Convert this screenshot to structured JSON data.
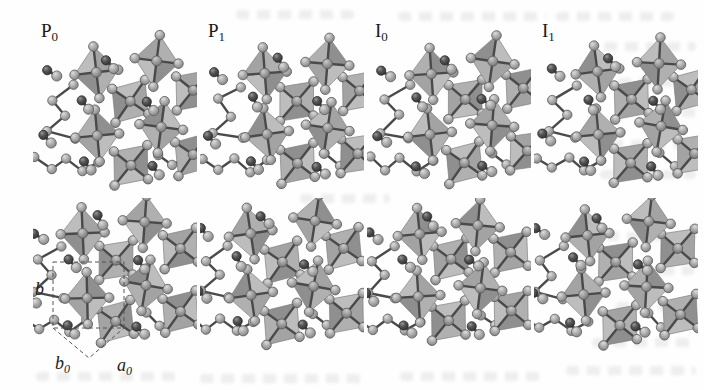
{
  "figure": {
    "type": "crystal-structure-figure",
    "panels": [
      {
        "id": "p0",
        "label_main": "P",
        "label_sub": "0",
        "row": 0,
        "col": 0
      },
      {
        "id": "p1",
        "label_main": "P",
        "label_sub": "1",
        "row": 0,
        "col": 1
      },
      {
        "id": "i0",
        "label_main": "I",
        "label_sub": "0",
        "row": 0,
        "col": 2
      },
      {
        "id": "i1",
        "label_main": "I",
        "label_sub": "1",
        "row": 0,
        "col": 3
      },
      {
        "id": "p0-lower",
        "label_main": "",
        "label_sub": "",
        "row": 1,
        "col": 0,
        "has_cell_annotation": true
      },
      {
        "id": "p1-lower",
        "label_main": "",
        "label_sub": "",
        "row": 1,
        "col": 1
      },
      {
        "id": "i0-lower",
        "label_main": "",
        "label_sub": "",
        "row": 1,
        "col": 2
      },
      {
        "id": "i1-lower",
        "label_main": "",
        "label_sub": "",
        "row": 1,
        "col": 3
      }
    ],
    "cell_annotation": {
      "b_label": "b",
      "b0_main": "b",
      "b0_sub": "0",
      "a0_main": "a",
      "a0_sub": "0"
    }
  },
  "colors": {
    "page_bg": "#fefefe",
    "face_light": "#bdbdbd",
    "face_mid": "#a3a3a3",
    "face_alt": "#b0b0b0",
    "face_dark": "#8f8f8f",
    "edge": "#7b7b7b",
    "bond": "#4a4a4a",
    "atom_light_stroke": "#5c5c5c",
    "atom_dark_stroke": "#2b2b2b",
    "annotation_line": "#555555",
    "label_ink": "#191919",
    "showthrough": "#8a8a8a"
  },
  "motif": {
    "octa_rx": 22,
    "octa_ry": 26,
    "octahedra": [
      {
        "cx": 97,
        "cy": 90,
        "rot": 38,
        "kind": "tilted"
      },
      {
        "cx": 158,
        "cy": 80,
        "rot": 38,
        "kind": "tilted"
      },
      {
        "cx": 97,
        "cy": 153,
        "rot": 38,
        "kind": "tilted"
      },
      {
        "cx": 158,
        "cy": 143,
        "rot": 38,
        "kind": "tilted"
      },
      {
        "cx": 65,
        "cy": 63,
        "rot": -6,
        "kind": "upright"
      },
      {
        "cx": 126,
        "cy": 53,
        "rot": 5,
        "kind": "upright"
      },
      {
        "cx": 65,
        "cy": 126,
        "rot": -5,
        "kind": "upright"
      },
      {
        "cx": 126,
        "cy": 116,
        "rot": 6,
        "kind": "upright"
      }
    ],
    "chains": [
      [
        [
          42,
          76
        ],
        [
          18,
          90
        ],
        [
          32,
          106
        ],
        [
          14,
          122
        ],
        [
          42,
          128
        ]
      ],
      [
        [
          2,
          148
        ],
        [
          18,
          159
        ],
        [
          34,
          149
        ],
        [
          50,
          161
        ],
        [
          66,
          151
        ]
      ],
      [
        [
          126,
          144
        ],
        [
          140,
          156
        ],
        [
          157,
          147
        ]
      ]
    ],
    "dumbbells": [
      {
        "x": 20,
        "y": 64,
        "a": 40
      },
      {
        "x": 79,
        "y": 52,
        "a": 52
      },
      {
        "x": 54,
        "y": 94,
        "a": 56
      },
      {
        "x": 120,
        "y": 95,
        "a": 42
      },
      {
        "x": 14,
        "y": 127,
        "a": 42
      },
      {
        "x": 52,
        "y": 158,
        "a": 50
      },
      {
        "x": 122,
        "y": 158,
        "a": 42
      }
    ]
  }
}
